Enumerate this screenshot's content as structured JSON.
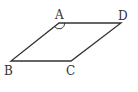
{
  "figure": {
    "type": "parallelogram",
    "stroke_color": "#333333",
    "vertices": [
      {
        "label": "A",
        "x": 59,
        "y": 23
      },
      {
        "label": "D",
        "x": 121,
        "y": 23
      },
      {
        "label": "C",
        "x": 71,
        "y": 61
      },
      {
        "label": "B",
        "x": 11,
        "y": 61
      }
    ],
    "angle_mark": {
      "vertex": "A"
    }
  }
}
